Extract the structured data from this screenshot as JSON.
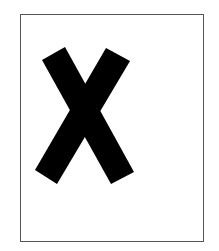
{
  "figure": {
    "symbol": "X",
    "icon": "x-mark-icon",
    "colors": {
      "background": "#ffffff",
      "border": "#555555",
      "mark": "#000000"
    }
  }
}
